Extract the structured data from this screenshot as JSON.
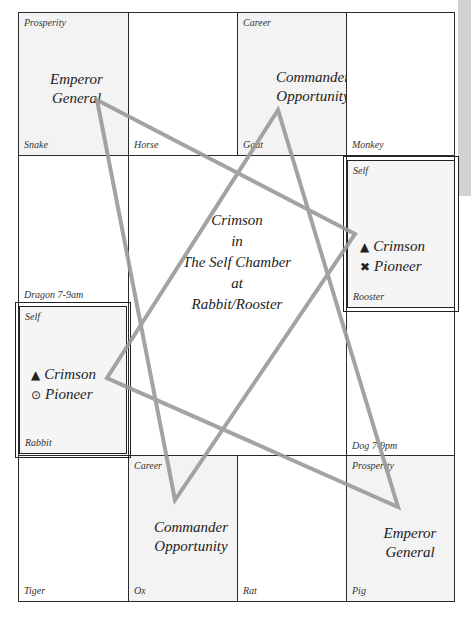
{
  "palaces": {
    "snake": {
      "branch": "Snake",
      "palace": "Prosperity",
      "stars": [
        "Emperor",
        "General"
      ]
    },
    "horse": {
      "branch": "Horse"
    },
    "goat": {
      "branch": "Goat",
      "palace": "Career",
      "stars": [
        "Commander",
        "Opportunity"
      ]
    },
    "monkey": {
      "branch": "Monkey"
    },
    "dragon": {
      "branch": "Dragon 7-9am"
    },
    "rooster": {
      "branch": "Rooster",
      "palace": "Self",
      "stars": [
        {
          "glyph": "▲",
          "name": "Crimson"
        },
        {
          "glyph": "✖",
          "name": "Pioneer"
        }
      ]
    },
    "rabbit": {
      "branch": "Rabbit",
      "palace": "Self",
      "stars": [
        {
          "glyph": "▲",
          "name": "Crimson"
        },
        {
          "glyph": "⊙",
          "name": "Pioneer"
        }
      ]
    },
    "dog": {
      "branch": "Dog 7-9pm"
    },
    "tiger": {
      "branch": "Tiger"
    },
    "ox": {
      "branch": "Ox",
      "palace": "Career",
      "stars": [
        "Commander",
        "Opportunity"
      ]
    },
    "rat": {
      "branch": "Rat"
    },
    "pig": {
      "branch": "Pig",
      "palace": "Prosperity",
      "stars": [
        "Emperor",
        "General"
      ]
    }
  },
  "center": {
    "line1": "Crimson",
    "line2": "in",
    "line3": "The Self Chamber",
    "line4": "at",
    "line5": "Rabbit/Rooster"
  },
  "colors": {
    "line": "#9a9a9a",
    "shaded": "#f3f3f3",
    "border": "#2a2a2a"
  }
}
